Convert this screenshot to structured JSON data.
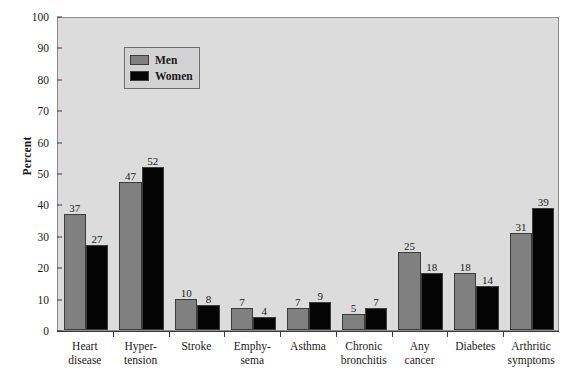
{
  "chart_data": {
    "type": "bar",
    "title": "",
    "xlabel": "",
    "ylabel": "Percent",
    "ylim": [
      0,
      100
    ],
    "yticks": [
      0,
      10,
      20,
      30,
      40,
      50,
      60,
      70,
      80,
      90,
      100
    ],
    "grid": false,
    "legend_position": "top-left",
    "categories": [
      "Heart disease",
      "Hyper-tension",
      "Stroke",
      "Emphy-sema",
      "Asthma",
      "Chronic bronchitis",
      "Any cancer",
      "Diabetes",
      "Arthritic symptoms"
    ],
    "category_lines": [
      [
        "Heart",
        "disease"
      ],
      [
        "Hyper-",
        "tension"
      ],
      [
        "Stroke",
        ""
      ],
      [
        "Emphy-",
        "sema"
      ],
      [
        "Asthma",
        ""
      ],
      [
        "Chronic",
        "bronchitis"
      ],
      [
        "Any",
        "cancer"
      ],
      [
        "Diabetes",
        ""
      ],
      [
        "Arthritic",
        "symptoms"
      ]
    ],
    "series": [
      {
        "name": "Men",
        "color": "#808080",
        "values": [
          37,
          47,
          10,
          7,
          7,
          5,
          25,
          18,
          31
        ]
      },
      {
        "name": "Women",
        "color": "#050505",
        "values": [
          27,
          52,
          8,
          4,
          9,
          7,
          18,
          14,
          39
        ]
      }
    ]
  },
  "legend": {
    "items": [
      {
        "label": "Men"
      },
      {
        "label": "Women"
      }
    ]
  },
  "colors": {
    "plot_background": "#dcdcdc",
    "men_bar": "#808080",
    "women_bar": "#050505",
    "axis": "#3a3a3a",
    "page_background": "#ffffff"
  }
}
